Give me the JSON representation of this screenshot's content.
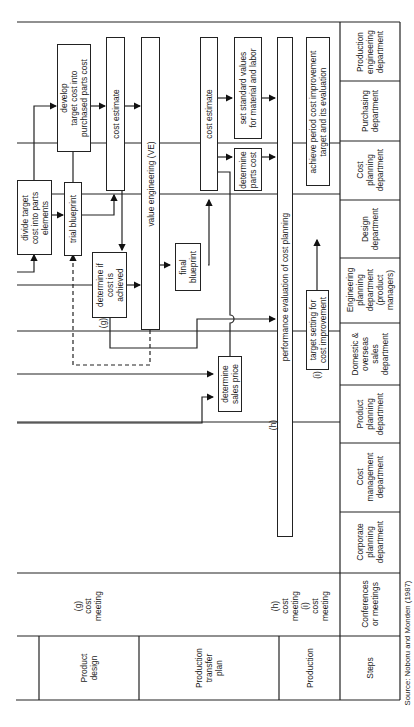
{
  "figure": {
    "source": "Source: Noboru and Monden (1987)"
  },
  "columns": {
    "header_steps": "Steps",
    "header_meetings": "Conferences\nor meetings",
    "departments": [
      "Corporate\nplanning\ndepartment",
      "Cost\nmanagement\ndepartment",
      "Product\nplanning\ndepartment",
      "Domestic &\noverseas\nsales\ndepartment",
      "Engineering\nplanning\ndepartment\n(product\nmanagers)",
      "Design\ndepartment",
      "Cost\nplanning\ndepartment",
      "Purchasing\ndepartment",
      "Production\nengineering\ndepartment"
    ]
  },
  "steps": [
    "Product\ndesign",
    "Production\ntransfer\nplan",
    "Production"
  ],
  "meetings": {
    "g": "(g)\ncost\nmeeting",
    "hi": "(h)\ncost\nmeeting\n(i)\ncost\nmeeting"
  },
  "boxes": {
    "divide_target": "divide target\ncost into parts\nelements",
    "develop_target": "develop\ntarget cost into\npurchased parts cost",
    "trial_blueprint": "trial blueprint",
    "cost_estimate_1": "cost estimate",
    "value_engineering": "value engineering (VE)",
    "determine_achieved": "determine if\ncost is\nachieved",
    "final_blueprint": "final\nblueprint",
    "cost_estimate_2": "cost estimate",
    "set_standard": "set standard values\nfor material and labor",
    "determine_parts": "determine\nparts cost",
    "determine_sales": "determine\nsales price",
    "performance_eval": "performance evaluation of cost planning",
    "target_setting": "target setting for\ncost improvement",
    "achieve_period": "achieve period cost improvement\ntarget and its evaluation"
  },
  "markers": {
    "g": "(g)",
    "h": "(h)",
    "i": "(i)"
  }
}
